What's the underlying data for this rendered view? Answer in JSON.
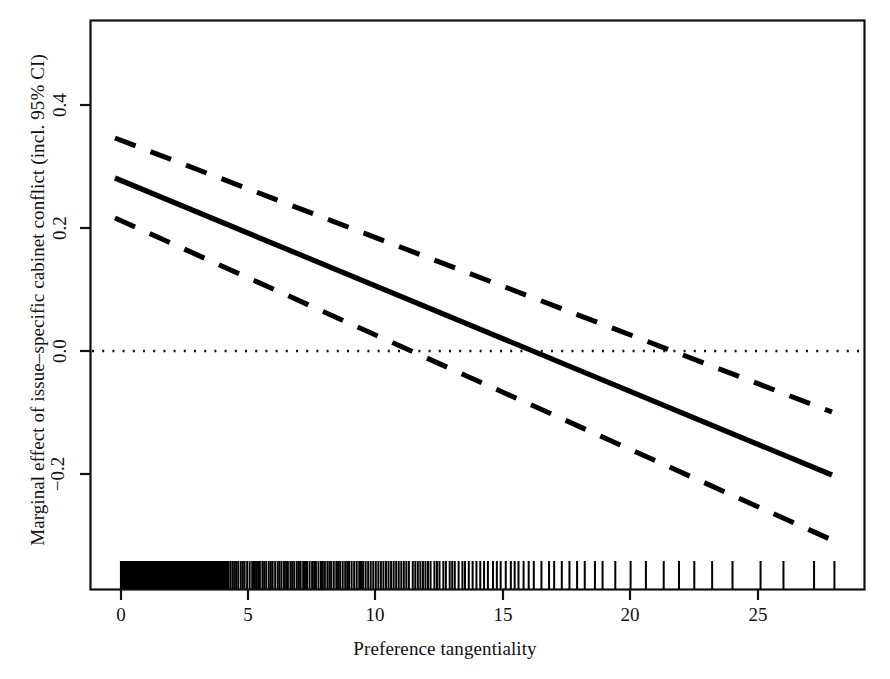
{
  "chart_data": {
    "type": "line",
    "title": "",
    "xlabel": "Preference tangentiality",
    "ylabel": "Marginal effect of issue–specific cabinet conflict (incl. 95% CI)",
    "xlim": [
      -0.9,
      28.9
    ],
    "ylim": [
      -0.32,
      0.5
    ],
    "xticks": [
      0,
      5,
      10,
      15,
      20,
      25
    ],
    "xticklabels": [
      "0",
      "5",
      "10",
      "15",
      "20",
      "25"
    ],
    "yticks": [
      -0.2,
      0.0,
      0.2,
      0.4
    ],
    "yticklabels": [
      "−0.2",
      "0.0",
      "0.2",
      "0.4"
    ],
    "grid": false,
    "legend": null,
    "reference_line": {
      "name": "zero-line",
      "y": 0.0,
      "style": "dotted",
      "color": "#111111"
    },
    "series": [
      {
        "name": "Marginal effect",
        "style": "solid",
        "color": "#000000",
        "x": [
          0,
          28
        ],
        "values": [
          0.281,
          -0.201
        ]
      },
      {
        "name": "Upper 95% CI",
        "style": "dashed",
        "color": "#000000",
        "x": [
          0,
          28
        ],
        "values": [
          0.334,
          -0.099
        ]
      },
      {
        "name": "Lower 95% CI",
        "style": "dashed",
        "color": "#000000",
        "x": [
          0,
          28
        ],
        "values": [
          0.216,
          -0.307
        ]
      }
    ],
    "annotations": [
      {
        "name": "zero-crossing-estimate",
        "x": 16.3,
        "y": 0.0
      },
      {
        "name": "zero-crossing-lower-ci",
        "x": 12.5,
        "y": 0.0
      },
      {
        "name": "zero-crossing-upper-ci",
        "x": 20.6,
        "y": 0.0
      }
    ],
    "rug": {
      "name": "preference-tangentiality-rug",
      "position": "bottom",
      "description": "Dense rug of observed preference tangentiality values, saturated 0-4, thinning above 15",
      "values": [
        0.02,
        0.05,
        0.08,
        0.11,
        0.14,
        0.17,
        0.2,
        0.23,
        0.26,
        0.29,
        0.32,
        0.35,
        0.38,
        0.41,
        0.44,
        0.47,
        0.5,
        0.53,
        0.56,
        0.59,
        0.62,
        0.65,
        0.68,
        0.71,
        0.74,
        0.77,
        0.8,
        0.83,
        0.86,
        0.89,
        0.92,
        0.95,
        0.98,
        1.01,
        1.04,
        1.07,
        1.1,
        1.13,
        1.16,
        1.19,
        1.22,
        1.25,
        1.28,
        1.31,
        1.34,
        1.37,
        1.4,
        1.43,
        1.46,
        1.49,
        1.52,
        1.55,
        1.58,
        1.61,
        1.64,
        1.67,
        1.7,
        1.73,
        1.76,
        1.79,
        1.82,
        1.85,
        1.88,
        1.91,
        1.94,
        1.97,
        2.0,
        2.03,
        2.06,
        2.09,
        2.12,
        2.15,
        2.18,
        2.21,
        2.24,
        2.27,
        2.3,
        2.33,
        2.36,
        2.39,
        2.42,
        2.45,
        2.48,
        2.51,
        2.54,
        2.57,
        2.6,
        2.63,
        2.66,
        2.69,
        2.72,
        2.75,
        2.78,
        2.81,
        2.84,
        2.87,
        2.9,
        2.93,
        2.96,
        2.99,
        3.02,
        3.05,
        3.08,
        3.11,
        3.14,
        3.17,
        3.2,
        3.23,
        3.26,
        3.29,
        3.32,
        3.35,
        3.38,
        3.41,
        3.44,
        3.47,
        3.5,
        3.53,
        3.56,
        3.59,
        3.62,
        3.65,
        3.68,
        3.71,
        3.74,
        3.77,
        3.8,
        3.83,
        3.86,
        3.89,
        3.92,
        3.95,
        3.98,
        4.01,
        4.04,
        4.07,
        4.1,
        4.16,
        4.22,
        4.3,
        4.38,
        4.45,
        4.52,
        4.6,
        4.7,
        4.78,
        4.85,
        4.95,
        5.05,
        5.15,
        5.22,
        5.3,
        5.38,
        5.45,
        5.55,
        5.62,
        5.7,
        5.8,
        5.88,
        5.95,
        6.05,
        6.15,
        6.22,
        6.3,
        6.4,
        6.48,
        6.55,
        6.65,
        6.72,
        6.8,
        6.9,
        6.98,
        7.05,
        7.15,
        7.22,
        7.3,
        7.4,
        7.5,
        7.58,
        7.65,
        7.75,
        7.85,
        7.92,
        8.0,
        8.1,
        8.18,
        8.25,
        8.35,
        8.45,
        8.52,
        8.6,
        8.7,
        8.8,
        8.88,
        8.95,
        9.05,
        9.15,
        9.25,
        9.35,
        9.42,
        9.5,
        9.6,
        9.7,
        9.8,
        9.9,
        10.0,
        10.1,
        10.2,
        10.3,
        10.4,
        10.5,
        10.6,
        10.7,
        10.8,
        10.9,
        11.0,
        11.1,
        11.2,
        11.3,
        11.45,
        11.55,
        11.65,
        11.75,
        11.85,
        11.95,
        12.05,
        12.15,
        12.3,
        12.4,
        12.5,
        12.65,
        12.75,
        12.9,
        13.0,
        13.1,
        13.25,
        13.4,
        13.5,
        13.65,
        13.8,
        13.95,
        14.1,
        14.25,
        14.4,
        14.6,
        14.75,
        14.9,
        15.1,
        15.3,
        15.45,
        15.6,
        15.8,
        16.0,
        16.2,
        16.5,
        16.8,
        17.0,
        17.3,
        17.6,
        17.9,
        18.2,
        18.6,
        18.9,
        19.4,
        20.0,
        20.6,
        21.3,
        21.9,
        22.5,
        23.2,
        24.0,
        25.1,
        26.0,
        27.2,
        28.0
      ]
    }
  },
  "axes": {
    "x_label": "Preference tangentiality",
    "y_label": "Marginal effect of issue–specific cabinet conflict (incl. 95% CI)",
    "x_tick_labels": [
      "0",
      "5",
      "10",
      "15",
      "20",
      "25"
    ],
    "y_tick_labels": [
      "−0.2",
      "0.0",
      "0.2",
      "0.4"
    ]
  }
}
